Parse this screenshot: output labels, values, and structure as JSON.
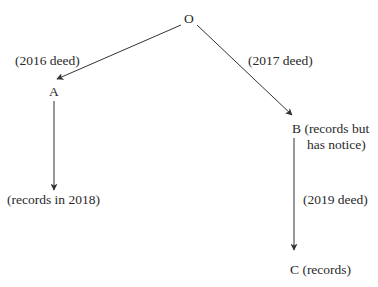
{
  "diagram": {
    "nodes": {
      "O": {
        "label": "O"
      },
      "A": {
        "label": "A",
        "note": "(records in 2018)"
      },
      "B": {
        "label_line1": "B (records but",
        "label_line2": "has notice)"
      },
      "C": {
        "label": "C (records)"
      }
    },
    "edges": [
      {
        "from": "O",
        "to": "A",
        "label": "(2016 deed)"
      },
      {
        "from": "O",
        "to": "B",
        "label": "(2017 deed)"
      },
      {
        "from": "A",
        "to": "A-records",
        "label": ""
      },
      {
        "from": "B",
        "to": "C",
        "label": "(2019 deed)"
      }
    ],
    "colors": {
      "line": "#333333",
      "text": "#2a2a2a",
      "background": "#ffffff"
    }
  }
}
